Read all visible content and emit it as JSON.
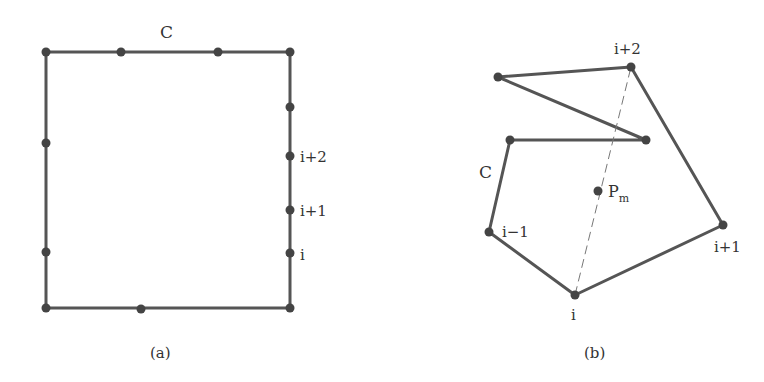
{
  "figure_a": {
    "caption": "(a)",
    "curve_label": "C",
    "rectangle": {
      "x1": 46,
      "y1": 52,
      "x2": 290,
      "y2": 308
    },
    "points": [
      {
        "x": 46,
        "y": 52
      },
      {
        "x": 121,
        "y": 52
      },
      {
        "x": 218,
        "y": 52
      },
      {
        "x": 290,
        "y": 52
      },
      {
        "x": 290,
        "y": 107
      },
      {
        "x": 290,
        "y": 156
      },
      {
        "x": 290,
        "y": 210
      },
      {
        "x": 290,
        "y": 253
      },
      {
        "x": 290,
        "y": 308
      },
      {
        "x": 141,
        "y": 309
      },
      {
        "x": 46,
        "y": 308
      },
      {
        "x": 46,
        "y": 252
      },
      {
        "x": 46,
        "y": 143
      }
    ],
    "vertex_labels": [
      {
        "text": "i+2",
        "x": 300,
        "y": 162
      },
      {
        "text": "i+1",
        "x": 300,
        "y": 216
      },
      {
        "text": "i",
        "x": 300,
        "y": 260
      }
    ]
  },
  "figure_b": {
    "caption": "(b)",
    "curve_label": "C",
    "polygon": [
      {
        "x": 498,
        "y": 77
      },
      {
        "x": 631,
        "y": 67
      },
      {
        "x": 723,
        "y": 225
      },
      {
        "x": 575,
        "y": 295
      },
      {
        "x": 489,
        "y": 232
      },
      {
        "x": 510,
        "y": 140
      },
      {
        "x": 646,
        "y": 140
      }
    ],
    "dashed_line": {
      "from": {
        "x": 575,
        "y": 295
      },
      "to": {
        "x": 631,
        "y": 67
      }
    },
    "midpoint": {
      "x": 598,
      "y": 191,
      "label": "P",
      "subscript": "m"
    },
    "vertex_labels": [
      {
        "text": "i+2",
        "x": 614,
        "y": 54
      },
      {
        "text": "i+1",
        "x": 714,
        "y": 252
      },
      {
        "text": "i",
        "x": 571,
        "y": 320
      },
      {
        "text": "i−1",
        "x": 502,
        "y": 237
      }
    ]
  }
}
